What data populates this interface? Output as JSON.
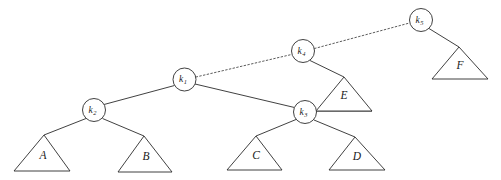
{
  "diagram": {
    "kind": "binary-tree",
    "width": 501,
    "height": 180,
    "background_color": "#ffffff",
    "stroke_color": "#2b2b2b",
    "dotted_stroke_color": "#4a4a4a",
    "nodes": [
      {
        "id": "k1",
        "base": "k",
        "sub": "1",
        "label": "k1",
        "cx": 184.5,
        "cy": 79.5,
        "r": 11.5
      },
      {
        "id": "k2",
        "base": "k",
        "sub": "2",
        "label": "k2",
        "cx": 94.0,
        "cy": 110.0,
        "r": 11.5
      },
      {
        "id": "k3",
        "base": "k",
        "sub": "3",
        "label": "k3",
        "cx": 305.0,
        "cy": 112.0,
        "r": 11.5
      },
      {
        "id": "k4",
        "base": "k",
        "sub": "4",
        "label": "k4",
        "cx": 303.0,
        "cy": 51.0,
        "r": 11.5
      },
      {
        "id": "k5",
        "base": "k",
        "sub": "5",
        "label": "k5",
        "cx": 421.0,
        "cy": 20.0,
        "r": 11.5
      }
    ],
    "subtrees": [
      {
        "id": "A",
        "label": "A",
        "apex_x": 44.0,
        "apex_y": 135.0,
        "left_x": 14.0,
        "right_x": 70.0,
        "base_y": 171.0,
        "label_x": 43.0,
        "label_y": 156.0
      },
      {
        "id": "B",
        "label": "B",
        "apex_x": 144.0,
        "apex_y": 136.0,
        "left_x": 118.0,
        "right_x": 172.0,
        "base_y": 172.0,
        "label_x": 146.0,
        "label_y": 157.0
      },
      {
        "id": "C",
        "label": "C",
        "apex_x": 256.0,
        "apex_y": 136.0,
        "left_x": 227.0,
        "right_x": 282.0,
        "base_y": 170.0,
        "label_x": 256.0,
        "label_y": 156.0
      },
      {
        "id": "D",
        "label": "D",
        "apex_x": 355.0,
        "apex_y": 137.0,
        "left_x": 329.0,
        "right_x": 385.0,
        "base_y": 170.0,
        "label_x": 357.0,
        "label_y": 157.0
      },
      {
        "id": "E",
        "label": "E",
        "apex_x": 344.0,
        "apex_y": 77.0,
        "left_x": 316.0,
        "right_x": 372.0,
        "base_y": 111.0,
        "label_x": 344.0,
        "label_y": 96.0
      },
      {
        "id": "F",
        "label": "F",
        "apex_x": 459.0,
        "apex_y": 47.0,
        "left_x": 432.0,
        "right_x": 488.0,
        "base_y": 79.0,
        "label_x": 460.0,
        "label_y": 66.0
      }
    ],
    "edges": [
      {
        "id": "k1-k2",
        "from": "k1",
        "to": "k2",
        "style": "solid",
        "x1": 174.5,
        "y1": 85.5,
        "x2": 104.0,
        "y2": 104.5
      },
      {
        "id": "k1-k3",
        "from": "k1",
        "to": "k3",
        "style": "solid",
        "x1": 195.0,
        "y1": 84.0,
        "x2": 294.5,
        "y2": 107.5
      },
      {
        "id": "k2-A",
        "from": "k2",
        "to": "A",
        "style": "solid",
        "x1": 86.0,
        "y1": 118.5,
        "x2": 44.0,
        "y2": 135.0
      },
      {
        "id": "k2-B",
        "from": "k2",
        "to": "B",
        "style": "solid",
        "x1": 102.5,
        "y1": 118.5,
        "x2": 144.0,
        "y2": 136.0
      },
      {
        "id": "k3-C",
        "from": "k3",
        "to": "C",
        "style": "solid",
        "x1": 296.0,
        "y1": 119.5,
        "x2": 256.0,
        "y2": 136.0
      },
      {
        "id": "k3-D",
        "from": "k3",
        "to": "D",
        "style": "solid",
        "x1": 314.0,
        "y1": 120.0,
        "x2": 355.0,
        "y2": 137.0
      },
      {
        "id": "k3-E",
        "from": "k3",
        "to": "E",
        "style": "solid",
        "x1": 316.0,
        "y1": 111.0,
        "x2": 372.0,
        "y2": 111.0
      },
      {
        "id": "k4-E",
        "from": "k4",
        "to": "E",
        "style": "solid",
        "x1": 310.0,
        "y1": 60.5,
        "x2": 344.0,
        "y2": 77.0
      },
      {
        "id": "k5-F",
        "from": "k5",
        "to": "F",
        "style": "solid",
        "x1": 429.0,
        "y1": 28.5,
        "x2": 459.0,
        "y2": 47.0
      },
      {
        "id": "k1-k4",
        "from": "k1",
        "to": "k4",
        "style": "dotted",
        "x1": 196.0,
        "y1": 77.0,
        "x2": 291.5,
        "y2": 54.5
      },
      {
        "id": "k4-k5",
        "from": "k4",
        "to": "k5",
        "style": "dotted",
        "x1": 314.5,
        "y1": 48.5,
        "x2": 409.5,
        "y2": 23.0
      }
    ]
  }
}
